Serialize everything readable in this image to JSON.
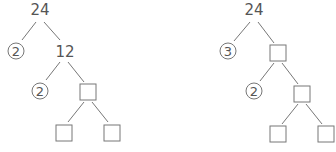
{
  "trees": [
    {
      "root": "24",
      "level1": {
        "circled": "2",
        "value": "12"
      },
      "level2": {
        "circled": "2",
        "value": ""
      },
      "level3": {
        "left": "",
        "right": ""
      }
    },
    {
      "root": "24",
      "level1": {
        "circled": "3",
        "value": ""
      },
      "level2": {
        "circled": "2",
        "value": ""
      },
      "level3": {
        "left": "",
        "right": ""
      }
    }
  ]
}
